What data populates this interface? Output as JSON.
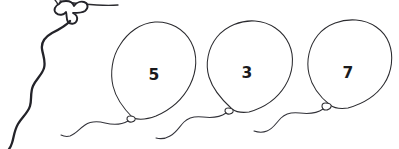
{
  "illustration": {
    "title": "Balloons with numbers",
    "style": "hand-drawn black line art on white",
    "background_color": "#ffffff",
    "line_color": "#2b2b2f",
    "numeral_color": "#1a1a1d"
  },
  "balloons": [
    {
      "id": "balloon-partial",
      "label": "",
      "visible_number": false,
      "note": "partial balloon knot cropped at top-left edge",
      "knot": {
        "x": 72,
        "y": 14
      },
      "string_color": "#232329"
    },
    {
      "id": "balloon-5",
      "label": "5",
      "visible_number": true,
      "center": {
        "x": 154,
        "y": 62
      },
      "radius": {
        "rx": 40,
        "ry": 47
      },
      "knot": {
        "x": 133,
        "y": 119
      },
      "number_position": {
        "x": 154,
        "y": 75
      },
      "string_color": "#33333a"
    },
    {
      "id": "balloon-3",
      "label": "3",
      "visible_number": true,
      "center": {
        "x": 250,
        "y": 60
      },
      "radius": {
        "rx": 42,
        "ry": 47
      },
      "knot": {
        "x": 232,
        "y": 110
      },
      "number_position": {
        "x": 247,
        "y": 73
      },
      "string_color": "#33333a"
    },
    {
      "id": "balloon-7",
      "label": "7",
      "visible_number": true,
      "center": {
        "x": 349,
        "y": 60
      },
      "radius": {
        "rx": 40,
        "ry": 46
      },
      "knot": {
        "x": 329,
        "y": 106
      },
      "number_position": {
        "x": 348,
        "y": 73
      },
      "string_color": "#33333a"
    }
  ],
  "numbers_shown": [
    "5",
    "3",
    "7"
  ],
  "canvas": {
    "width": 399,
    "height": 149
  }
}
